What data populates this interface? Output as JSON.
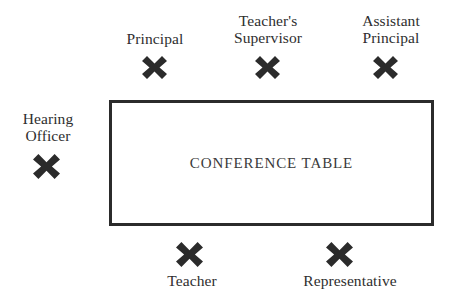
{
  "diagram": {
    "background_color": "#ffffff",
    "mark_color": "#2b2b2b",
    "table": {
      "label": "CONFERENCE TABLE",
      "border_color": "#2b2b2b",
      "fill_color": "#ffffff"
    },
    "seats": [
      {
        "id": "principal",
        "label": "Principal",
        "marker": "heavy-multiplication-x",
        "side": "top",
        "label_position": "above-marker"
      },
      {
        "id": "teachers-supervisor",
        "label": "Teacher's\nSupervisor",
        "marker": "heavy-multiplication-x",
        "side": "top",
        "label_position": "above-marker"
      },
      {
        "id": "assistant-principal",
        "label": "Assistant\nPrincipal",
        "marker": "heavy-multiplication-x",
        "side": "top",
        "label_position": "above-marker"
      },
      {
        "id": "hearing-officer",
        "label": "Hearing\nOfficer",
        "marker": "heavy-multiplication-x",
        "side": "left",
        "label_position": "above-marker"
      },
      {
        "id": "teacher",
        "label": "Teacher",
        "marker": "heavy-multiplication-x",
        "side": "bottom",
        "label_position": "below-marker"
      },
      {
        "id": "representative",
        "label": "Representative",
        "marker": "heavy-multiplication-x",
        "side": "bottom",
        "label_position": "below-marker"
      }
    ]
  }
}
